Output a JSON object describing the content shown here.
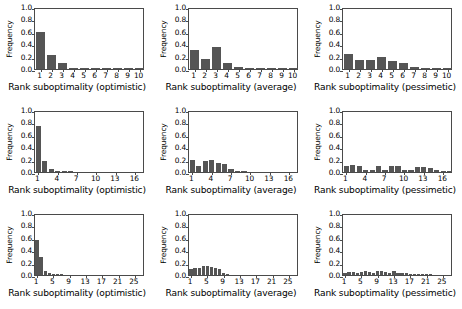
{
  "figure": {
    "title": "",
    "rows": 3,
    "cols": 3,
    "bar_color": "#555555",
    "axis_color": "#4a4a4a",
    "background": "#ffffff"
  },
  "chart_data": [
    {
      "type": "bar",
      "panel": "row1-col1",
      "title": "",
      "xlabel": "Rank suboptimality (optimistic)",
      "ylabel": "Frequency",
      "ylim": [
        0.0,
        1.0
      ],
      "yticks": [
        "0.0",
        "0.2",
        "0.4",
        "0.6",
        "0.8",
        "1.0"
      ],
      "ytick_values": [
        0.0,
        0.2,
        0.4,
        0.6,
        0.8,
        1.0
      ],
      "xticks": [
        "1",
        "2",
        "3",
        "4",
        "5",
        "6",
        "7",
        "8",
        "9",
        "10"
      ],
      "xtick_values": [
        1,
        2,
        3,
        4,
        5,
        6,
        7,
        8,
        9,
        10
      ],
      "xlim": [
        0.5,
        10.5
      ],
      "categories": [
        1,
        2,
        3,
        4,
        5,
        6,
        7,
        8,
        9,
        10
      ],
      "values": [
        0.59,
        0.22,
        0.1,
        0.02,
        0.01,
        0.01,
        0.01,
        0.005,
        0.005,
        0.005
      ],
      "grid": false,
      "legend": false
    },
    {
      "type": "bar",
      "panel": "row1-col2",
      "title": "",
      "xlabel": "Rank suboptimality (average)",
      "ylabel": "Frequency",
      "ylim": [
        0.0,
        1.0
      ],
      "yticks": [
        "0.0",
        "0.2",
        "0.4",
        "0.6",
        "0.8",
        "1.0"
      ],
      "ytick_values": [
        0.0,
        0.2,
        0.4,
        0.6,
        0.8,
        1.0
      ],
      "xticks": [
        "1",
        "2",
        "3",
        "4",
        "5",
        "6",
        "7",
        "8",
        "9",
        "10"
      ],
      "xtick_values": [
        1,
        2,
        3,
        4,
        5,
        6,
        7,
        8,
        9,
        10
      ],
      "xlim": [
        0.5,
        10.5
      ],
      "categories": [
        1,
        2,
        3,
        4,
        5,
        6,
        7,
        8,
        9,
        10
      ],
      "values": [
        0.31,
        0.16,
        0.36,
        0.09,
        0.03,
        0.02,
        0.01,
        0.01,
        0.01,
        0.005
      ],
      "grid": false,
      "legend": false
    },
    {
      "type": "bar",
      "panel": "row1-col3",
      "title": "",
      "xlabel": "Rank suboptimality (pessimetic)",
      "ylabel": "Frequency",
      "ylim": [
        0.0,
        1.0
      ],
      "yticks": [
        "0.0",
        "0.2",
        "0.4",
        "0.6",
        "0.8",
        "1.0"
      ],
      "ytick_values": [
        0.0,
        0.2,
        0.4,
        0.6,
        0.8,
        1.0
      ],
      "xticks": [
        "1",
        "2",
        "3",
        "4",
        "5",
        "6",
        "7",
        "8",
        "9",
        "10"
      ],
      "xtick_values": [
        1,
        2,
        3,
        4,
        5,
        6,
        7,
        8,
        9,
        10
      ],
      "xlim": [
        0.5,
        10.5
      ],
      "categories": [
        1,
        2,
        3,
        4,
        5,
        6,
        7,
        8,
        9,
        10
      ],
      "values": [
        0.24,
        0.15,
        0.15,
        0.19,
        0.13,
        0.1,
        0.04,
        0.01,
        0.005,
        0.005
      ],
      "grid": false,
      "legend": false
    },
    {
      "type": "bar",
      "panel": "row2-col1",
      "title": "",
      "xlabel": "Rank suboptimality (optimistic)",
      "ylabel": "Frequency",
      "ylim": [
        0.0,
        1.0
      ],
      "yticks": [
        "0.0",
        "0.2",
        "0.4",
        "0.6",
        "0.8",
        "1.0"
      ],
      "ytick_values": [
        0.0,
        0.2,
        0.4,
        0.6,
        0.8,
        1.0
      ],
      "xticks": [
        "1",
        "4",
        "7",
        "10",
        "13",
        "16"
      ],
      "xtick_values": [
        1,
        4,
        7,
        10,
        13,
        16
      ],
      "xlim": [
        0.5,
        17.5
      ],
      "categories": [
        1,
        2,
        3,
        4,
        5,
        6,
        7,
        8,
        9,
        10,
        11,
        12,
        13,
        14,
        15,
        16,
        17
      ],
      "values": [
        0.75,
        0.17,
        0.05,
        0.01,
        0.005,
        0.005,
        0.0,
        0.0,
        0.0,
        0.0,
        0.0,
        0.0,
        0.0,
        0.0,
        0.0,
        0.0,
        0.0
      ],
      "grid": false,
      "legend": false
    },
    {
      "type": "bar",
      "panel": "row2-col2",
      "title": "",
      "xlabel": "Rank suboptimality (average)",
      "ylabel": "Frequency",
      "ylim": [
        0.0,
        1.0
      ],
      "yticks": [
        "0.0",
        "0.2",
        "0.4",
        "0.6",
        "0.8",
        "1.0"
      ],
      "ytick_values": [
        0.0,
        0.2,
        0.4,
        0.6,
        0.8,
        1.0
      ],
      "xticks": [
        "1",
        "4",
        "7",
        "10",
        "13",
        "16"
      ],
      "xtick_values": [
        1,
        4,
        7,
        10,
        13,
        16
      ],
      "xlim": [
        0.5,
        17.5
      ],
      "categories": [
        1,
        2,
        3,
        4,
        5,
        6,
        7,
        8,
        9,
        10,
        11,
        12,
        13,
        14,
        15,
        16,
        17
      ],
      "values": [
        0.2,
        0.09,
        0.18,
        0.19,
        0.15,
        0.13,
        0.05,
        0.02,
        0.01,
        0.0,
        0.0,
        0.0,
        0.0,
        0.0,
        0.0,
        0.0,
        0.0
      ],
      "grid": false,
      "legend": false
    },
    {
      "type": "bar",
      "panel": "row2-col3",
      "title": "",
      "xlabel": "Rank suboptimality (pessimetic)",
      "ylabel": "Frequency",
      "ylim": [
        0.0,
        1.0
      ],
      "yticks": [
        "0.0",
        "0.2",
        "0.4",
        "0.6",
        "0.8",
        "1.0"
      ],
      "ytick_values": [
        0.0,
        0.2,
        0.4,
        0.6,
        0.8,
        1.0
      ],
      "xticks": [
        "1",
        "4",
        "7",
        "10",
        "13",
        "16"
      ],
      "xtick_values": [
        1,
        4,
        7,
        10,
        13,
        16
      ],
      "xlim": [
        0.5,
        17.5
      ],
      "categories": [
        1,
        2,
        3,
        4,
        5,
        6,
        7,
        8,
        9,
        10,
        11,
        12,
        13,
        14,
        15,
        16,
        17
      ],
      "values": [
        0.09,
        0.11,
        0.1,
        0.04,
        0.04,
        0.09,
        0.03,
        0.1,
        0.09,
        0.03,
        0.03,
        0.08,
        0.08,
        0.07,
        0.03,
        0.01,
        0.005
      ],
      "grid": false,
      "legend": false
    },
    {
      "type": "bar",
      "panel": "row3-col1",
      "title": "",
      "xlabel": "Rank suboptimality (optimistic)",
      "ylabel": "Frequency",
      "ylim": [
        0.0,
        1.0
      ],
      "yticks": [
        "0.0",
        "0.2",
        "0.4",
        "0.6",
        "0.8",
        "1.0"
      ],
      "ytick_values": [
        0.0,
        0.2,
        0.4,
        0.6,
        0.8,
        1.0
      ],
      "xticks": [
        "1",
        "5",
        "9",
        "13",
        "17",
        "21",
        "25"
      ],
      "xtick_values": [
        1,
        5,
        9,
        13,
        17,
        21,
        25
      ],
      "xlim": [
        0.5,
        27.5
      ],
      "categories": [
        1,
        2,
        3,
        4,
        5,
        6,
        7,
        8,
        9,
        10,
        11,
        12,
        13,
        14,
        15,
        16,
        17,
        18,
        19,
        20,
        21,
        22,
        23,
        24,
        25,
        26,
        27
      ],
      "values": [
        0.56,
        0.29,
        0.07,
        0.04,
        0.02,
        0.01,
        0.005,
        0.0,
        0.0,
        0.0,
        0.0,
        0.0,
        0.0,
        0.0,
        0.0,
        0.0,
        0.0,
        0.0,
        0.0,
        0.0,
        0.0,
        0.0,
        0.0,
        0.0,
        0.0,
        0.0,
        0.0
      ],
      "grid": false,
      "legend": false
    },
    {
      "type": "bar",
      "panel": "row3-col2",
      "title": "",
      "xlabel": "Rank suboptimality (average)",
      "ylabel": "Frequency",
      "ylim": [
        0.0,
        1.0
      ],
      "yticks": [
        "0.0",
        "0.2",
        "0.4",
        "0.6",
        "0.8",
        "1.0"
      ],
      "ytick_values": [
        0.0,
        0.2,
        0.4,
        0.6,
        0.8,
        1.0
      ],
      "xticks": [
        "1",
        "5",
        "9",
        "13",
        "17",
        "21",
        "25"
      ],
      "xtick_values": [
        1,
        5,
        9,
        13,
        17,
        21,
        25
      ],
      "xlim": [
        0.5,
        27.5
      ],
      "categories": [
        1,
        2,
        3,
        4,
        5,
        6,
        7,
        8,
        9,
        10,
        11,
        12,
        13,
        14,
        15,
        16,
        17,
        18,
        19,
        20,
        21,
        22,
        23,
        24,
        25,
        26,
        27
      ],
      "values": [
        0.09,
        0.12,
        0.11,
        0.14,
        0.15,
        0.13,
        0.12,
        0.1,
        0.04,
        0.01,
        0.0,
        0.0,
        0.0,
        0.0,
        0.0,
        0.0,
        0.0,
        0.0,
        0.0,
        0.0,
        0.0,
        0.0,
        0.0,
        0.0,
        0.0,
        0.0,
        0.0
      ],
      "grid": false,
      "legend": false
    },
    {
      "type": "bar",
      "panel": "row3-col3",
      "title": "",
      "xlabel": "Rank suboptimality (pessimetic)",
      "ylabel": "Frequency",
      "ylim": [
        0.0,
        1.0
      ],
      "yticks": [
        "0.0",
        "0.2",
        "0.4",
        "0.6",
        "0.8",
        "1.0"
      ],
      "ytick_values": [
        0.0,
        0.2,
        0.4,
        0.6,
        0.8,
        1.0
      ],
      "xticks": [
        "1",
        "5",
        "9",
        "13",
        "17",
        "21",
        "25"
      ],
      "xtick_values": [
        1,
        5,
        9,
        13,
        17,
        21,
        25
      ],
      "xlim": [
        0.5,
        27.5
      ],
      "categories": [
        1,
        2,
        3,
        4,
        5,
        6,
        7,
        8,
        9,
        10,
        11,
        12,
        13,
        14,
        15,
        16,
        17,
        18,
        19,
        20,
        21,
        22,
        23,
        24,
        25,
        26,
        27
      ],
      "values": [
        0.04,
        0.05,
        0.05,
        0.04,
        0.05,
        0.06,
        0.05,
        0.04,
        0.07,
        0.07,
        0.05,
        0.04,
        0.06,
        0.03,
        0.03,
        0.03,
        0.02,
        0.02,
        0.01,
        0.01,
        0.005,
        0.005,
        0.0,
        0.0,
        0.0,
        0.0,
        0.0
      ]
    }
  ]
}
